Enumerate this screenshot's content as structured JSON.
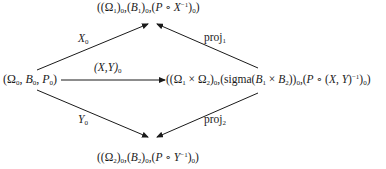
{
  "diagram": {
    "type": "commutative-diagram",
    "nodes": {
      "top": {
        "text": "((Ω₁)₀,(B₁)₀,(P∘X⁻¹)₀)",
        "parts": {
          "omega": "Ω",
          "omega_sub": "1",
          "b": "B",
          "b_sub": "1",
          "p": "P",
          "op": "∘",
          "x": "X",
          "inv": "−1",
          "outer_sub": "0"
        }
      },
      "left": {
        "text": "(Ω₀,B₀,P₀)",
        "parts": {
          "omega": "Ω",
          "b": "B",
          "p": "P",
          "sub": "0"
        }
      },
      "right": {
        "text": "((Ω₁×Ω₂)₀,(sigma(B₁×B₂))₀,(P∘(X,Y)⁻¹)₀)",
        "parts": {
          "omega": "Ω",
          "times": "×",
          "sigma": "sigma",
          "b": "B",
          "p": "P",
          "op": "∘",
          "x": "X",
          "y": "Y",
          "inv": "−1",
          "sub1": "1",
          "sub2": "2",
          "outer_sub": "0"
        }
      },
      "bottom": {
        "text": "((Ω₂)₀,(B₂)₀,(P∘Y⁻¹)₀)",
        "parts": {
          "omega": "Ω",
          "omega_sub": "2",
          "b": "B",
          "b_sub": "2",
          "p": "P",
          "op": "∘",
          "y": "Y",
          "inv": "−1",
          "outer_sub": "0"
        }
      }
    },
    "edges": [
      {
        "from": "left",
        "to": "top",
        "label": "X₀",
        "label_main": "X",
        "label_sub": "0"
      },
      {
        "from": "left",
        "to": "right",
        "label": "(X,Y)₀",
        "label_main": "(X,Y)",
        "label_sub": "0"
      },
      {
        "from": "left",
        "to": "bottom",
        "label": "Y₀",
        "label_main": "Y",
        "label_sub": "0"
      },
      {
        "from": "right",
        "to": "top",
        "label": "proj₁",
        "label_main": "proj",
        "label_sub": "1"
      },
      {
        "from": "right",
        "to": "bottom",
        "label": "proj₂",
        "label_main": "proj",
        "label_sub": "2"
      }
    ],
    "colors": {
      "ink": "#1a1a1a",
      "background": "#ffffff"
    }
  }
}
